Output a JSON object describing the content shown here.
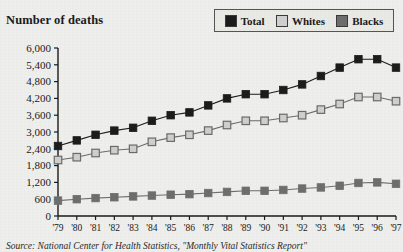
{
  "chart_title": "Number of deaths",
  "source_note": "Source: National Center for Health Statistics, \"Monthly Vital Statistics Report\"",
  "legend": {
    "items": [
      {
        "label": "Total",
        "color": "#1c1c1c",
        "swatch_name": "legend-swatch-total"
      },
      {
        "label": "Whites",
        "color": "#cfcfcf",
        "swatch_name": "legend-swatch-whites"
      },
      {
        "label": "Blacks",
        "color": "#6e6e6e",
        "swatch_name": "legend-swatch-blacks"
      }
    ]
  },
  "colors": {
    "total": "#1c1c1c",
    "whites": "#cfcfcf",
    "whites_outline": "#6b6b6b",
    "blacks": "#6e6e6e",
    "axis": "#1a1a1a",
    "background": "#eeeeec"
  },
  "chart_data": {
    "type": "line",
    "title": "Number of deaths",
    "xlabel": "",
    "ylabel": "Number of deaths",
    "ylim": [
      0,
      6000
    ],
    "ytick_labels": [
      "6,000",
      "5,400",
      "4,800",
      "4,200",
      "3,600",
      "3,000",
      "2,400",
      "1,800",
      "1,200",
      "600",
      "0"
    ],
    "ytick_values": [
      6000,
      5400,
      4800,
      4200,
      3600,
      3000,
      2400,
      1800,
      1200,
      600,
      0
    ],
    "grid": false,
    "legend_position": "top-right",
    "marker": "square",
    "categories": [
      "'79",
      "'80",
      "'81",
      "'82",
      "'83",
      "'84",
      "'85",
      "'86",
      "'87",
      "'88",
      "'89",
      "'90",
      "'91",
      "'92",
      "'93",
      "'94",
      "'95",
      "'96",
      "'97"
    ],
    "x": [
      1979,
      1980,
      1981,
      1982,
      1983,
      1984,
      1985,
      1986,
      1987,
      1988,
      1989,
      1990,
      1991,
      1992,
      1993,
      1994,
      1995,
      1996,
      1997
    ],
    "series": [
      {
        "name": "Total",
        "color": "#1c1c1c",
        "values": [
          2500,
          2700,
          2900,
          3050,
          3150,
          3400,
          3600,
          3700,
          3950,
          4200,
          4350,
          4350,
          4500,
          4700,
          5000,
          5300,
          5600,
          5600,
          5300
        ]
      },
      {
        "name": "Whites",
        "color": "#cfcfcf",
        "values": [
          2000,
          2100,
          2250,
          2350,
          2400,
          2650,
          2800,
          2900,
          3050,
          3250,
          3400,
          3400,
          3500,
          3600,
          3800,
          4000,
          4250,
          4250,
          4100
        ]
      },
      {
        "name": "Blacks",
        "color": "#6e6e6e",
        "values": [
          550,
          600,
          640,
          670,
          700,
          730,
          760,
          780,
          820,
          860,
          900,
          900,
          930,
          980,
          1020,
          1080,
          1180,
          1200,
          1150
        ]
      }
    ]
  }
}
